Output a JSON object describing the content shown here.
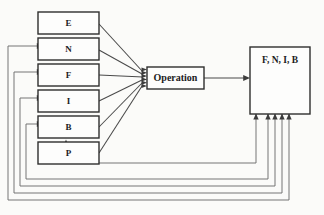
{
  "diagram": {
    "background_color": "#fbfbf9",
    "line_color": "#4a4a4a",
    "text_color": "#1c1c1c",
    "input_boxes": [
      {
        "label": "E",
        "name": "input-box-e"
      },
      {
        "label": "N",
        "name": "input-box-n"
      },
      {
        "label": "F",
        "name": "input-box-f"
      },
      {
        "label": "I",
        "name": "input-box-i"
      },
      {
        "label": "B",
        "name": "input-box-b"
      },
      {
        "label": "P",
        "name": "input-box-p"
      }
    ],
    "process_box": {
      "label": "Operation",
      "name": "operation-box"
    },
    "output_box": {
      "label": "F, N, I, B",
      "name": "output-box"
    },
    "edges": {
      "inputs_to_operation": 6,
      "operation_to_output": 1,
      "feedback_paths": 5,
      "feedback_targets": [
        "N",
        "F",
        "I",
        "B",
        "P"
      ]
    }
  }
}
